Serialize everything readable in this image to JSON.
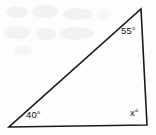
{
  "figure": {
    "kind": "geometry-diagram",
    "shape": "triangle",
    "background_color": "#fdfdfd",
    "stroke_color": "#1a1a1a",
    "stroke_width": 1.6,
    "text_color": "#131313",
    "vertices": {
      "apex": {
        "x": 141,
        "y": 9
      },
      "bottom_left": {
        "x": 9,
        "y": 127
      },
      "bottom_right": {
        "x": 147,
        "y": 125
      }
    },
    "labels": {
      "apex_angle": "55°",
      "bottom_left_angle": "40°",
      "bottom_right_angle": "x°"
    }
  },
  "chart_data": {
    "type": "diagram",
    "title": "",
    "subtitle": "",
    "shape": "triangle",
    "points": [
      {
        "name": "apex",
        "x": 141,
        "y": 9,
        "angle_label": "55°",
        "angle_value": 55
      },
      {
        "name": "bottom-left",
        "x": 9,
        "y": 127,
        "angle_label": "40°",
        "angle_value": 40
      },
      {
        "name": "bottom-right",
        "x": 147,
        "y": 125,
        "angle_label": "x°",
        "angle_value": null
      }
    ],
    "edges": [
      {
        "from": "bottom-left",
        "to": "apex"
      },
      {
        "from": "apex",
        "to": "bottom-right"
      },
      {
        "from": "bottom-right",
        "to": "bottom-left"
      }
    ],
    "annotations": [
      "55°",
      "40°",
      "x°"
    ],
    "legend": [],
    "grid": false,
    "xlabel": "",
    "ylabel": ""
  }
}
